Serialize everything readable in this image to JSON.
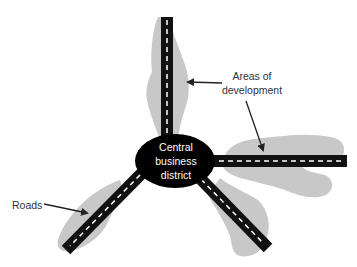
{
  "diagram": {
    "title": "",
    "type": "urban-model",
    "center": {
      "label_lines": [
        "Central",
        "business",
        "district"
      ]
    },
    "labels": {
      "development_lines": [
        "Areas of",
        "development"
      ],
      "roads": "Roads"
    },
    "colors": {
      "development_area": "#c8c8c8",
      "road": "#111111",
      "road_marking": "#ffffff",
      "cbd_fill": "#000000",
      "text": "#333333",
      "arrow": "#222222"
    },
    "roads": [
      {
        "name": "north",
        "direction": "up"
      },
      {
        "name": "east",
        "direction": "right"
      },
      {
        "name": "south-east",
        "direction": "down-right"
      },
      {
        "name": "south-west",
        "direction": "down-left"
      }
    ]
  }
}
